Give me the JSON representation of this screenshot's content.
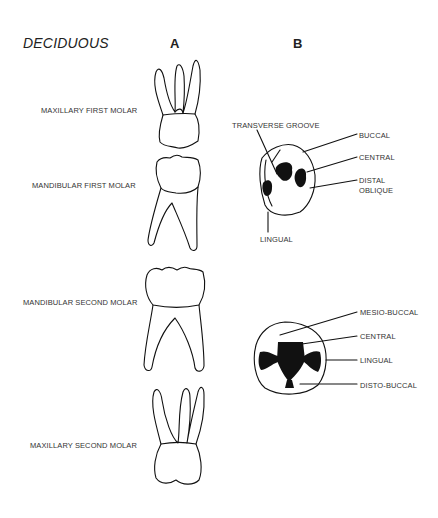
{
  "header": {
    "title": "DECIDUOUS",
    "column_a": "A",
    "column_b": "B"
  },
  "rows": [
    {
      "label": "MAXILLARY FIRST MOLAR"
    },
    {
      "label": "MANDIBULAR FIRST MOLAR"
    },
    {
      "label": "MANDIBULAR SECOND MOLAR"
    },
    {
      "label": "MAXILLARY SECOND MOLAR"
    }
  ],
  "occlusal_first": {
    "labels": [
      "TRANSVERSE GROOVE",
      "BUCCAL",
      "CENTRAL",
      "DISTAL",
      "OBLIQUE",
      "LINGUAL"
    ]
  },
  "occlusal_second": {
    "labels": [
      "MESIO-BUCCAL",
      "CENTRAL",
      "LINGUAL",
      "DISTO-BUCCAL"
    ]
  }
}
